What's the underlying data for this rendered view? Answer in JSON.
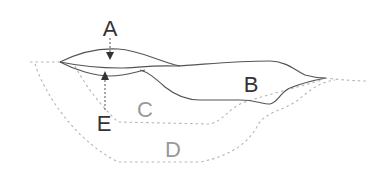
{
  "diagram": {
    "labels": {
      "A": "A",
      "B": "B",
      "C": "C",
      "D": "D",
      "E": "E"
    },
    "colors": {
      "solid_line": "#555555",
      "dashed_line": "#b0b0b0",
      "dark_label": "#333333",
      "grey_label": "#999999",
      "background": "#ffffff"
    }
  }
}
